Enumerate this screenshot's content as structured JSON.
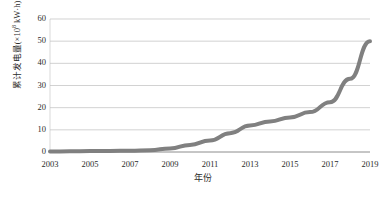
{
  "chart_data": {
    "type": "line",
    "title": "",
    "xlabel": "年份",
    "ylabel": "累计发电量(×10⁸ kW·h)",
    "ylabel_parts": {
      "prefix": "累计发电量(×10",
      "exponent": "8",
      "suffix": " kW·h)"
    },
    "xlim": [
      2003,
      2019
    ],
    "ylim": [
      0,
      60
    ],
    "ytick_labels": [
      "60",
      "50",
      "40",
      "30",
      "20",
      "10",
      "0"
    ],
    "ytick_values": [
      60,
      50,
      40,
      30,
      20,
      10,
      0
    ],
    "xtick_labels": [
      "2003",
      "2005",
      "2007",
      "2009",
      "2011",
      "2013",
      "2015",
      "2017",
      "2019"
    ],
    "xtick_values": [
      2003,
      2005,
      2007,
      2009,
      2011,
      2013,
      2015,
      2017,
      2019
    ],
    "grid": "horizontal",
    "legend": "none",
    "x": [
      2003,
      2004,
      2005,
      2006,
      2007,
      2008,
      2009,
      2010,
      2011,
      2012,
      2013,
      2014,
      2015,
      2016,
      2017,
      2018,
      2019
    ],
    "values": [
      0.2,
      0.3,
      0.4,
      0.5,
      0.6,
      0.8,
      1.6,
      3.2,
      5.2,
      8.5,
      12.0,
      13.8,
      15.6,
      18.0,
      22.5,
      33.0,
      50.0
    ],
    "series_name": "累计发电量",
    "line_color": "#808080",
    "line_width_px": 4,
    "grid_color": "#bfbfbf",
    "axis_color": "#808080",
    "background": "#ffffff"
  }
}
